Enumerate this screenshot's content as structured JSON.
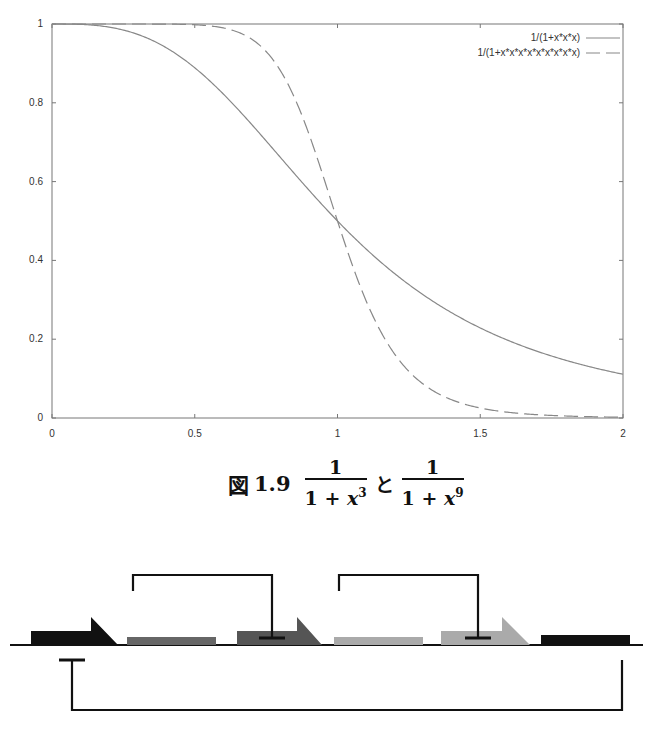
{
  "chart_data": {
    "type": "line",
    "title": "",
    "xlabel": "",
    "ylabel": "",
    "xlim": [
      0,
      2
    ],
    "ylim": [
      0,
      1
    ],
    "grid": false,
    "legend_position": "top-right, inside",
    "x_ticks": [
      "0",
      "0.5",
      "1",
      "1.5",
      "2"
    ],
    "y_ticks": [
      "0",
      "0.2",
      "0.4",
      "0.6",
      "0.8",
      "1"
    ],
    "series": [
      {
        "name": "1/(1+x*x*x)",
        "style": "solid",
        "formula_exponent": 3,
        "x": [
          0,
          0.25,
          0.5,
          0.75,
          1.0,
          1.25,
          1.5,
          1.75,
          2.0
        ],
        "values": [
          1.0,
          0.985,
          0.889,
          0.703,
          0.5,
          0.339,
          0.229,
          0.157,
          0.111
        ]
      },
      {
        "name": "1/(1+x*x*x*x*x*x*x*x*x)",
        "style": "dashed",
        "formula_exponent": 9,
        "x": [
          0,
          0.25,
          0.5,
          0.75,
          1.0,
          1.25,
          1.5,
          1.75,
          2.0
        ],
        "values": [
          1.0,
          1.0,
          0.998,
          0.93,
          0.5,
          0.105,
          0.025,
          0.006,
          0.002
        ]
      }
    ]
  },
  "plot": {
    "frame": {
      "left": 52,
      "right": 623,
      "top": 24,
      "bottom": 418
    },
    "x_tick_labels": [
      "0",
      "0.5",
      "1",
      "1.5",
      "2"
    ],
    "y_tick_labels": [
      "0",
      "0.2",
      "0.4",
      "0.6",
      "0.8",
      "1"
    ],
    "legend": [
      {
        "label": "1/(1+x*x*x)",
        "style": "solid"
      },
      {
        "label": "1/(1+x*x*x*x*x*x*x*x*x)",
        "style": "dashed"
      }
    ],
    "line_color": "#888888"
  },
  "caption": {
    "figure_label": "図",
    "figure_number": "1.9",
    "frac1": {
      "numerator": "1",
      "den_prefix": "1 + ",
      "var": "x",
      "exp": "3"
    },
    "conjunction": "と",
    "frac2": {
      "numerator": "1",
      "den_prefix": "1 + ",
      "var": "x",
      "exp": "9"
    }
  },
  "diagram": {
    "baseline_y": 85,
    "baseline": {
      "x1": 10,
      "x2": 643
    },
    "promoters": [
      {
        "name": "promoter-1",
        "x": 31,
        "w": 60,
        "h": 14,
        "tip": 118,
        "flag_top": 57,
        "color": "#111111"
      },
      {
        "name": "promoter-2",
        "x": 237,
        "w": 60,
        "h": 14,
        "tip": 322,
        "flag_top": 57,
        "color": "#555555"
      },
      {
        "name": "promoter-3",
        "x": 441,
        "w": 61,
        "h": 14,
        "tip": 530,
        "flag_top": 57,
        "color": "#aaaaaa"
      }
    ],
    "genes": [
      {
        "name": "gene-1",
        "x": 127,
        "w": 89,
        "h": 8,
        "color": "#666666"
      },
      {
        "name": "gene-2",
        "x": 334,
        "w": 89,
        "h": 8,
        "color": "#aaaaaa"
      },
      {
        "name": "gene-3",
        "x": 541,
        "w": 89,
        "h": 10,
        "color": "#111111"
      }
    ],
    "repressions": [
      {
        "name": "repression-1-to-2",
        "from_x": 133,
        "to_x": 272,
        "top_y": 15,
        "start_y": 78,
        "bar_y": 80,
        "direction": "up"
      },
      {
        "name": "repression-2-to-3",
        "from_x": 339,
        "to_x": 478,
        "top_y": 15,
        "start_y": 78,
        "bar_y": 80,
        "direction": "up"
      },
      {
        "name": "repression-3-to-1",
        "from_x": 622,
        "to_x": 72,
        "bottom_y": 178,
        "start_y": 118,
        "bar_y": 98,
        "direction": "down"
      }
    ]
  }
}
